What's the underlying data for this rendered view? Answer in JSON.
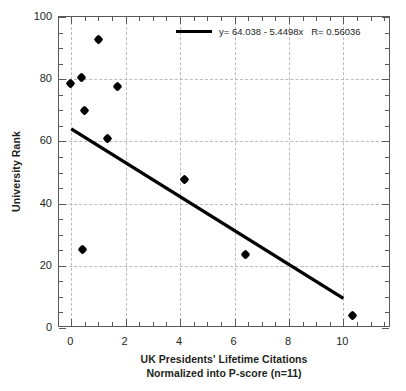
{
  "chart_data": {
    "type": "scatter",
    "title": "",
    "xlabel": "UK Presidents' Lifetime Citations\nNormalized into P-score (n=11)",
    "xlabel_line1": "UK Presidents' Lifetime Citations",
    "xlabel_line2": "Normalized into P-score (n=11)",
    "ylabel": "University Rank",
    "xlim": [
      -0.45,
      11.75
    ],
    "ylim": [
      0,
      100
    ],
    "xticks": [
      0,
      2,
      4,
      6,
      8,
      10,
      12
    ],
    "xtick_labels": [
      "0",
      "2",
      "4",
      "6",
      "8",
      "10",
      "12"
    ],
    "yticks": [
      0,
      20,
      40,
      60,
      80,
      100
    ],
    "ytick_labels": [
      "0",
      "20",
      "40",
      "60",
      "80",
      "100"
    ],
    "x_minor_step": 0.5,
    "y_minor_step": 5,
    "grid": true,
    "grid_style": "dashed",
    "grid_color": "#b9bbbd",
    "marker_color": "#000000",
    "marker_shape": "diamond",
    "points": [
      {
        "x": -0.04,
        "y": 78.5
      },
      {
        "x": 0.37,
        "y": 80.7
      },
      {
        "x": 0.48,
        "y": 69.8
      },
      {
        "x": 0.4,
        "y": 25.4
      },
      {
        "x": 0.99,
        "y": 92.9
      },
      {
        "x": 1.32,
        "y": 60.8
      },
      {
        "x": 1.69,
        "y": 77.8
      },
      {
        "x": 4.15,
        "y": 47.6
      },
      {
        "x": 6.42,
        "y": 23.5
      },
      {
        "x": 10.35,
        "y": 3.9
      }
    ],
    "fit_line": {
      "type": "linear",
      "intercept": 64.038,
      "slope": -5.4498,
      "r": 0.56036,
      "x_start": 0.0,
      "x_end": 10.0,
      "color": "#000000",
      "width": 3.4
    },
    "legend": {
      "position": "top-right",
      "entries": [
        {
          "marker": "line",
          "label": "y= 64.038 - 5.4498x   R= 0.56036"
        }
      ]
    }
  }
}
